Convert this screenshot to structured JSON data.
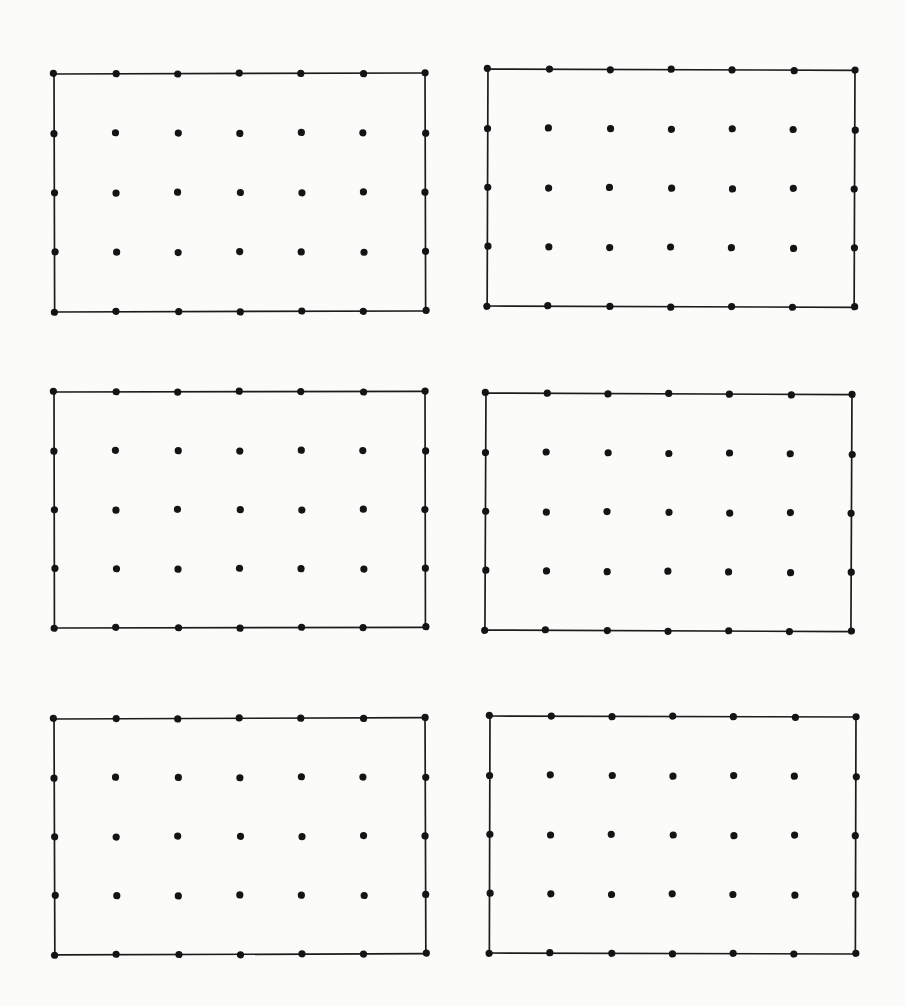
{
  "figure": {
    "background_color": "#fbfbf9",
    "ink_color": "#141414",
    "line_color": "#1c1c1c",
    "canvas": {
      "width": 906,
      "height": 1007
    }
  },
  "grid_spec": {
    "columns": 7,
    "rows": 5,
    "dots_per_panel": 35,
    "total_panels": 6,
    "total_dots": 210,
    "dot_radius_px": 3.6,
    "border_stroke_px": 1.7,
    "arrangement": "2 columns x 3 rows of panels"
  },
  "chart_data": {
    "type": "scatter",
    "subtitle": "",
    "xlabel": "",
    "ylabel": "",
    "grid": false,
    "legend": "none",
    "xlim": [
      0,
      906
    ],
    "ylim": [
      0,
      1007
    ],
    "panels": [
      {
        "name": "panel-top-left",
        "index": 1,
        "position": "top-left",
        "origin_x": 54,
        "origin_y": 74,
        "width": 371,
        "height": 238,
        "rotation_deg": -0.15,
        "columns": 7,
        "rows": 5,
        "col_spacing": 61.8,
        "row_spacing": 59.4,
        "dot_count": 35
      },
      {
        "name": "panel-top-right",
        "index": 2,
        "position": "top-right",
        "origin_x": 488,
        "origin_y": 69,
        "width": 367,
        "height": 237,
        "rotation_deg": 0.2,
        "columns": 7,
        "rows": 5,
        "col_spacing": 61.1,
        "row_spacing": 59.2,
        "dot_count": 35
      },
      {
        "name": "panel-middle-left",
        "index": 3,
        "position": "middle-left",
        "origin_x": 54,
        "origin_y": 392,
        "width": 371,
        "height": 236,
        "rotation_deg": -0.1,
        "columns": 7,
        "rows": 5,
        "col_spacing": 61.8,
        "row_spacing": 59.0,
        "dot_count": 35
      },
      {
        "name": "panel-middle-right",
        "index": 4,
        "position": "middle-right",
        "origin_x": 486,
        "origin_y": 393,
        "width": 366,
        "height": 237,
        "rotation_deg": 0.25,
        "columns": 7,
        "rows": 5,
        "col_spacing": 61.0,
        "row_spacing": 59.2,
        "dot_count": 35
      },
      {
        "name": "panel-bottom-left",
        "index": 5,
        "position": "bottom-left",
        "origin_x": 54,
        "origin_y": 719,
        "width": 371,
        "height": 236,
        "rotation_deg": -0.2,
        "columns": 7,
        "rows": 5,
        "col_spacing": 61.8,
        "row_spacing": 59.0,
        "dot_count": 35
      },
      {
        "name": "panel-bottom-right",
        "index": 6,
        "position": "bottom-right",
        "origin_x": 490,
        "origin_y": 716,
        "width": 366,
        "height": 237,
        "rotation_deg": 0.15,
        "columns": 7,
        "rows": 5,
        "col_spacing": 61.0,
        "row_spacing": 59.2,
        "dot_count": 35
      }
    ]
  }
}
